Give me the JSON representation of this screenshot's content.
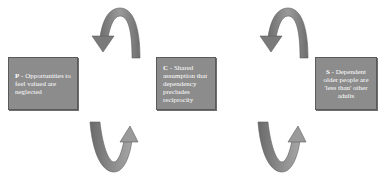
{
  "diagram": {
    "nodes": [
      {
        "id": "P",
        "letter": "P",
        "separator": " - ",
        "text": "Opportunities to feel valued are neglected"
      },
      {
        "id": "C",
        "letter": "C",
        "separator": " - ",
        "text": "Shared assumption that dependency precludes reciprocity"
      },
      {
        "id": "S",
        "letter": "S",
        "separator": " - ",
        "text": "Dependent older people are 'less than' other adults"
      }
    ],
    "connectors": [
      {
        "from": "C",
        "to": "P",
        "shape": "arc-over",
        "icon": "curved-arrow-left-icon"
      },
      {
        "from": "P",
        "to": "C",
        "shape": "arc-under",
        "icon": "curved-arrow-up-icon"
      },
      {
        "from": "S",
        "to": "C",
        "shape": "arc-over",
        "icon": "curved-arrow-left-icon"
      },
      {
        "from": "C",
        "to": "S",
        "shape": "arc-under",
        "icon": "curved-arrow-up-icon"
      }
    ],
    "colors": {
      "box_fill": "#8c8c8c",
      "box_border": "#5a5a5a",
      "arrow_fill": "#7a7a7a",
      "text": "#ffffff"
    }
  }
}
